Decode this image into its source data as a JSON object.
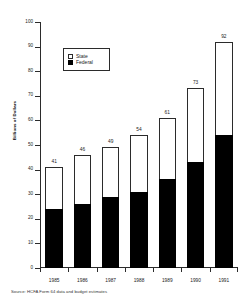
{
  "chart_data": {
    "type": "bar",
    "subtype": "stacked-bar",
    "title": "",
    "xlabel": "",
    "ylabel": "Billions of Dollars",
    "categories": [
      "1985",
      "1986",
      "1987",
      "1988",
      "1989",
      "1990",
      "1991"
    ],
    "series": [
      {
        "name": "Federal",
        "color": "#000000",
        "values": [
          24,
          26,
          29,
          31,
          36,
          43,
          54
        ]
      },
      {
        "name": "State",
        "color": "#ffffff",
        "values": [
          17,
          20,
          20,
          23,
          25,
          30,
          38
        ]
      }
    ],
    "totals": [
      41,
      46,
      49,
      54,
      61,
      73,
      92
    ],
    "ylim": [
      0,
      100
    ],
    "yticks": [
      0,
      10,
      20,
      30,
      40,
      50,
      60,
      70,
      80,
      90,
      100
    ],
    "ytick_labels": [
      "0",
      "10",
      "20",
      "30",
      "40",
      "50",
      "60",
      "70",
      "80",
      "90",
      "100"
    ],
    "grid": false,
    "legend_position": "upper-left-inside",
    "stack_order": [
      "Federal",
      "State"
    ],
    "data_labels": "totals-above-bars"
  },
  "legend": {
    "items": [
      {
        "label": "State",
        "swatch": "hollow"
      },
      {
        "label": "Federal",
        "swatch": "filled"
      }
    ]
  },
  "footer": {
    "source": "Source: HCFA Form 64 data and budget estimates"
  }
}
